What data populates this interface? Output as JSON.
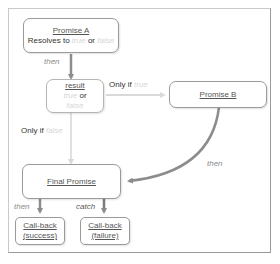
{
  "diagram": {
    "nodes": {
      "promise_a": {
        "title": "Promise A",
        "line2_prefix": "Resolves to",
        "true_word": "true",
        "or_word": "or",
        "false_word": "false"
      },
      "result": {
        "title": "result",
        "true_word": "true",
        "or_word": "or",
        "false_word": "false"
      },
      "promise_b": {
        "title": "Promise B"
      },
      "final_promise": {
        "title": "Final Promise"
      },
      "callback_success": {
        "line1": "Call-back",
        "line2": "(success)"
      },
      "callback_failure": {
        "line1": "Call-back",
        "line2": "(failure)"
      }
    },
    "edges": {
      "a_to_result": {
        "label": "then"
      },
      "result_to_b": {
        "label_prefix": "Only if",
        "label_value": "true"
      },
      "result_to_final": {
        "label_prefix": "Only if",
        "label_value": "false"
      },
      "b_to_final": {
        "label": "then"
      },
      "final_to_success": {
        "label": "then"
      },
      "final_to_failure": {
        "label": "catch"
      }
    },
    "colors": {
      "border": "#9a9a9a",
      "arrow_dark": "#8c8c8c",
      "arrow_light": "#d9d9d9",
      "muted_text": "#d6d6d6",
      "label_italic": "#8a8a8a"
    }
  }
}
